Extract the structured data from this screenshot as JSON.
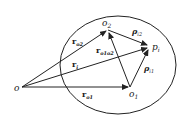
{
  "diagram": {
    "type": "vector-geometry",
    "points": {
      "o": {
        "label": "o",
        "x": 22,
        "y": 87
      },
      "o2": {
        "label": "o",
        "sub": "2",
        "x": 108,
        "y": 30
      },
      "o1": {
        "label": "o",
        "sub": "1",
        "x": 130,
        "y": 87
      },
      "pi": {
        "label": "p",
        "sub": "i",
        "x": 150,
        "y": 47
      }
    },
    "vectors": {
      "r_o2": {
        "label": "r",
        "sub": "o2"
      },
      "r_i": {
        "label": "r",
        "sub": "i"
      },
      "r_o1": {
        "label": "r",
        "sub": "o1"
      },
      "r_o1o2": {
        "label": "r",
        "sub": "o1o2"
      },
      "rho_i2": {
        "label": "ρ",
        "sub": "i2"
      },
      "rho_i1": {
        "label": "ρ",
        "sub": "i1"
      }
    },
    "ellipse": {
      "cx": 118,
      "cy": 65,
      "rx": 58,
      "ry": 49
    }
  }
}
